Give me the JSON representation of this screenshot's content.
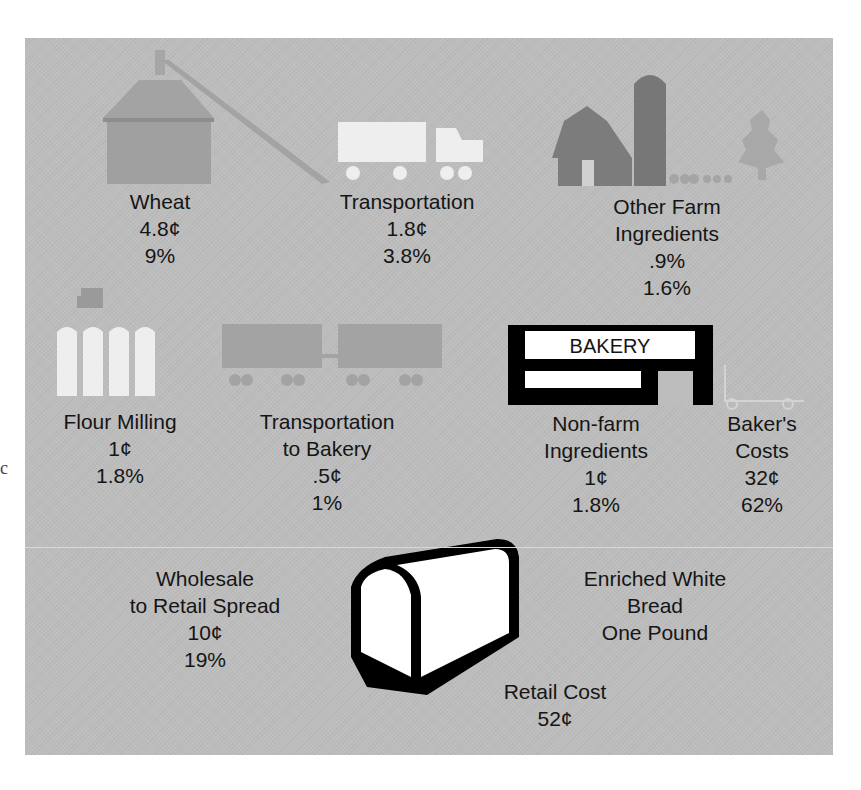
{
  "colors": {
    "panel_bg": "#bdbdbd",
    "mid_gray": "#9c9c9c",
    "dark_gray": "#7a7a7a",
    "light": "#eeeeee",
    "black": "#000000"
  },
  "stray_glyph": "c",
  "stages": [
    {
      "id": "wheat",
      "lines": [
        "Wheat"
      ],
      "cost": "4.8¢",
      "percent": "9%",
      "icon": "grain-elevator-icon"
    },
    {
      "id": "transportation",
      "lines": [
        "Transportation"
      ],
      "cost": "1.8¢",
      "percent": "3.8%",
      "icon": "truck-icon"
    },
    {
      "id": "other-farm",
      "lines": [
        "Other Farm",
        "Ingredients"
      ],
      "cost": ".9%",
      "percent": "1.6%",
      "icon": "barn-silo-icon"
    },
    {
      "id": "flour-milling",
      "lines": [
        "Flour Milling"
      ],
      "cost": "1¢",
      "percent": "1.8%",
      "icon": "flour-mill-icon"
    },
    {
      "id": "transportation-bakery",
      "lines": [
        "Transportation",
        "to Bakery"
      ],
      "cost": ".5¢",
      "percent": "1%",
      "icon": "tractor-trailer-icon"
    },
    {
      "id": "non-farm",
      "lines": [
        "Non-farm",
        "Ingredients"
      ],
      "cost": "1¢",
      "percent": "1.8%",
      "icon": "bakery-building-icon"
    },
    {
      "id": "bakers-costs",
      "lines": [
        "Baker's",
        "Costs"
      ],
      "cost": "32¢",
      "percent": "62%",
      "icon": "hand-cart-icon"
    },
    {
      "id": "wholesale-retail",
      "lines": [
        "Wholesale",
        "to Retail Spread"
      ],
      "cost": "10¢",
      "percent": "19%"
    }
  ],
  "bakery_sign": "BAKERY",
  "product": {
    "lines": [
      "Enriched White",
      "Bread",
      "One Pound"
    ],
    "icon": "bread-loaf-icon"
  },
  "retail": {
    "label": "Retail Cost",
    "value": "52¢"
  }
}
